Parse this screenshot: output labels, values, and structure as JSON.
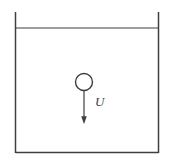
{
  "figure": {
    "velocity_label": "U",
    "line_color": "#3f3f3f",
    "text_color": "#3f3f3f",
    "sphere_fill": "#ffffff",
    "background": "#ffffff"
  }
}
